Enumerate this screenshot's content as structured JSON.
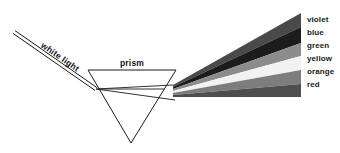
{
  "diagram": {
    "background_color": "#ffffff",
    "stroke_color": "#1a1a1a",
    "annotations": {
      "incident_ray_label": "white light",
      "prism_label": "prism"
    },
    "prism": {
      "shape": "inverted-triangle",
      "top_left": [
        88,
        70
      ],
      "top_right": [
        176,
        70
      ],
      "apex": [
        131,
        143
      ],
      "inner_line_y": 89
    },
    "incident_ray": {
      "start": [
        14,
        32
      ],
      "end": [
        96,
        89
      ],
      "label_rotation_deg": 34
    },
    "spectrum": {
      "origin": [
        173,
        86
      ],
      "right_edge_x": 301,
      "bands": [
        {
          "name": "violet",
          "label": "violet",
          "color": "#4a4a4a",
          "y_right_top": 13,
          "y_right_bottom": 27,
          "y_origin_top": 85.0,
          "y_origin_bottom": 87.0,
          "label_y": 16
        },
        {
          "name": "blue",
          "label": "blue",
          "color": "#1c1c1c",
          "y_right_top": 27,
          "y_right_bottom": 43,
          "y_origin_top": 87.0,
          "y_origin_bottom": 89.0,
          "label_y": 29
        },
        {
          "name": "green",
          "label": "green",
          "color": "#8c8c8c",
          "y_right_top": 43,
          "y_right_bottom": 56,
          "y_origin_top": 89.0,
          "y_origin_bottom": 91.0,
          "label_y": 42
        },
        {
          "name": "yellow",
          "label": "yellow",
          "color": "#f2f2f2",
          "y_right_top": 56,
          "y_right_bottom": 70,
          "y_origin_top": 91.0,
          "y_origin_bottom": 93.0,
          "label_y": 55
        },
        {
          "name": "orange",
          "label": "orange",
          "color": "#7d7d7d",
          "y_right_top": 70,
          "y_right_bottom": 84,
          "y_origin_top": 93.0,
          "y_origin_bottom": 95.0,
          "label_y": 68
        },
        {
          "name": "red",
          "label": "red",
          "color": "#4f4f4f",
          "y_right_top": 84,
          "y_right_bottom": 97,
          "y_origin_top": 95.0,
          "y_origin_bottom": 97.0,
          "label_y": 81
        }
      ],
      "label_x": 307
    }
  }
}
